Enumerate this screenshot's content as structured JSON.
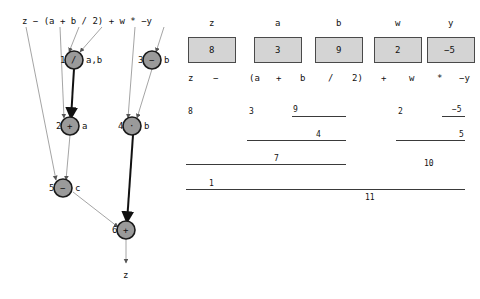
{
  "expression": {
    "text": "z − (a + b / 2) + w * −y",
    "tokens": [
      "z",
      "−",
      "(a",
      "+",
      "b",
      "/",
      "2)",
      "+",
      "w",
      "*",
      "−y"
    ]
  },
  "dag": {
    "title": "expression-dag",
    "nodes": [
      {
        "id": "1",
        "op": "/",
        "label": "a,b",
        "x": 74,
        "y": 60
      },
      {
        "id": "3",
        "op": "−",
        "label": "b",
        "x": 152,
        "y": 60
      },
      {
        "id": "2",
        "op": "+",
        "label": "a",
        "x": 70,
        "y": 126
      },
      {
        "id": "4",
        "op": "·",
        "label": "b",
        "x": 132,
        "y": 126
      },
      {
        "id": "5",
        "op": "−",
        "label": "c",
        "x": 63,
        "y": 188
      },
      {
        "id": "6",
        "op": "+",
        "label": "",
        "x": 126,
        "y": 230
      }
    ],
    "output_label": "z"
  },
  "variables": {
    "names": [
      "z",
      "a",
      "b",
      "w",
      "y"
    ],
    "values": [
      "8",
      "3",
      "9",
      "2",
      "−5"
    ]
  },
  "evaluation": {
    "rows": [
      {
        "row": 1,
        "values": [
          "8",
          "3",
          "9",
          "2",
          "−5"
        ]
      },
      {
        "row": 2,
        "values": [
          "4",
          "5"
        ]
      },
      {
        "row": 3,
        "values": [
          "7",
          "10"
        ]
      },
      {
        "row": 4,
        "values": [
          "1",
          "11"
        ]
      }
    ],
    "leaf_values": [
      "8",
      "3",
      "9",
      "2",
      "−5"
    ],
    "intermediate_values": [
      "4",
      "5",
      "7",
      "10",
      "1",
      "11"
    ]
  },
  "colors": {
    "node_fill": "#9a9a9a",
    "node_stroke": "#1a1a1a",
    "box_fill": "#d4d4d4",
    "box_stroke": "#4a4a4a",
    "edge_thin": "#8a8a8a",
    "edge_thick": "#111111",
    "text": "#111111"
  }
}
